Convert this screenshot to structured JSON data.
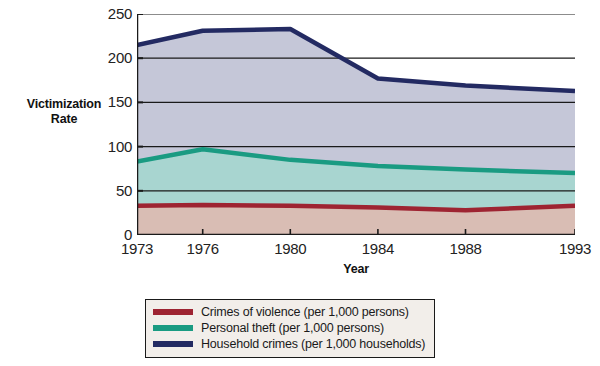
{
  "chart_data": {
    "type": "area",
    "title": "",
    "xlabel": "Year",
    "ylabel": "Victimization Rate",
    "categories": [
      "1973",
      "1976",
      "1980",
      "1984",
      "1988",
      "1993"
    ],
    "x": [
      1973,
      1976,
      1980,
      1984,
      1988,
      1993
    ],
    "xlim": [
      1973,
      1993
    ],
    "ylim": [
      0,
      250
    ],
    "yticks": [
      "0",
      "50",
      "100",
      "150",
      "200",
      "250"
    ],
    "ytick_values": [
      0,
      50,
      100,
      150,
      200,
      250
    ],
    "grid": true,
    "grid_axis": "y",
    "legend_position": "bottom",
    "stacked": false,
    "series": [
      {
        "name": "Crimes of violence (per 1,000 persons)",
        "short_name": "Crimes of violence",
        "unit": "per 1,000 persons",
        "line_color": "#9e2432",
        "fill_color": "#d9bdb4",
        "values": [
          33,
          34,
          33,
          31,
          28,
          33
        ]
      },
      {
        "name": "Personal theft (per 1,000 persons)",
        "short_name": "Personal theft",
        "unit": "per 1,000 persons",
        "line_color": "#1a9b82",
        "fill_color": "#a8d5d0",
        "values": [
          83,
          97,
          85,
          78,
          74,
          70
        ]
      },
      {
        "name": "Household crimes (per 1,000 households)",
        "short_name": "Household crimes",
        "unit": "per 1,000 households",
        "line_color": "#232a62",
        "fill_color": "#c5c7d8",
        "values": [
          215,
          231,
          233,
          177,
          169,
          163
        ]
      }
    ]
  },
  "axes": {
    "y_title_line1": "Victimization",
    "y_title_line2": "Rate",
    "x_title": "Year"
  },
  "colors": {
    "axis": "#1a1a1a",
    "grid": "#1a1a1a",
    "background": "#ffffff",
    "legend_background": "#f2eeea",
    "legend_border": "#1a1a1a"
  }
}
